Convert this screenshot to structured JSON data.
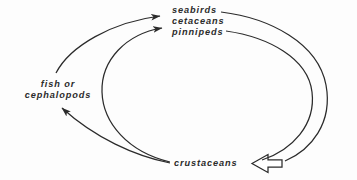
{
  "diagram": {
    "background_color": "#fdfdfd",
    "ink_color": "#2b2b2b",
    "nodes": [
      {
        "id": "predators",
        "lines": [
          "seabirds",
          "cetaceans",
          "pinnipeds"
        ]
      },
      {
        "id": "prey",
        "lines": [
          "fish or",
          "cephalopods"
        ]
      },
      {
        "id": "crustaceans",
        "lines": [
          "crustaceans"
        ]
      }
    ],
    "edges": [
      {
        "id": "prey-to-predators",
        "from": "fish or cephalopods",
        "to": "seabirds cetaceans pinnipeds",
        "arrowhead": "solid"
      },
      {
        "id": "crustaceans-to-predators",
        "from": "crustaceans",
        "to": "pinnipeds",
        "arrowhead": "solid"
      },
      {
        "id": "crustaceans-to-prey",
        "from": "crustaceans",
        "to": "cephalopods",
        "arrowhead": "solid"
      },
      {
        "id": "seabirds-to-crustaceans",
        "from": "seabirds",
        "to": "crustaceans",
        "arrowhead": "hollow"
      },
      {
        "id": "pinnipeds-to-crustaceans",
        "from": "pinnipeds",
        "to": "crustaceans",
        "arrowhead": "none"
      }
    ]
  }
}
